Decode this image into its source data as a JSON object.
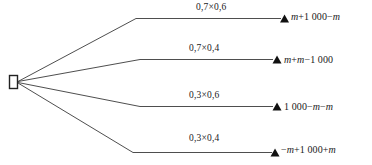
{
  "diagram": {
    "type": "probability-tree",
    "root_node": {
      "shape": "rectangle",
      "label": ""
    },
    "branches": [
      {
        "probability_label": "0,7×0,6",
        "probability_value": 0.42,
        "outcome_parts": [
          {
            "text": "m",
            "italic": true
          },
          {
            "text": "+1 000−",
            "italic": false
          },
          {
            "text": "m",
            "italic": true
          }
        ],
        "outcome_text": "m+1 000−m",
        "marker": "triangle-marker"
      },
      {
        "probability_label": "0,7×0,4",
        "probability_value": 0.28,
        "outcome_parts": [
          {
            "text": "m",
            "italic": true
          },
          {
            "text": "+",
            "italic": false
          },
          {
            "text": "m",
            "italic": true
          },
          {
            "text": "−1 000",
            "italic": false
          }
        ],
        "outcome_text": "m+m−1 000",
        "marker": "triangle-marker"
      },
      {
        "probability_label": "0,3×0,6",
        "probability_value": 0.18,
        "outcome_parts": [
          {
            "text": "1 000−",
            "italic": false
          },
          {
            "text": "m",
            "italic": true
          },
          {
            "text": "−",
            "italic": false
          },
          {
            "text": "m",
            "italic": true
          }
        ],
        "outcome_text": "1 000−m−m",
        "marker": "triangle-marker"
      },
      {
        "probability_label": "0,3×0,4",
        "probability_value": 0.12,
        "outcome_parts": [
          {
            "text": "−",
            "italic": false
          },
          {
            "text": "m",
            "italic": true
          },
          {
            "text": "+1 000+",
            "italic": false
          },
          {
            "text": "m",
            "italic": true
          }
        ],
        "outcome_text": "−m+1 000+m",
        "marker": "triangle-marker"
      }
    ],
    "colors": {
      "line": "#3a3a3a",
      "text": "#1a1a1a",
      "background": "#ffffff",
      "marker": "#111111"
    }
  }
}
